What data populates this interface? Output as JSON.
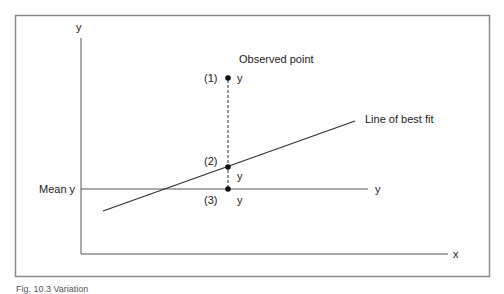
{
  "diagram": {
    "axes": {
      "y_label": "y",
      "x_label": "x"
    },
    "mean_line": {
      "left_label": "Mean y",
      "right_label": "y"
    },
    "best_fit": {
      "label": "Line of best fit"
    },
    "observed": {
      "label": "Observed point"
    },
    "points": [
      {
        "id": "(1)",
        "label": "(1)",
        "value_label": "y"
      },
      {
        "id": "(2)",
        "label": "(2)",
        "value_label": "y"
      },
      {
        "id": "(3)",
        "label": "(3)",
        "value_label": "y"
      }
    ],
    "caption": "Fig. 10.3  Variation"
  },
  "colors": {
    "frame": "#8a8a8a",
    "axis": "#555555",
    "line": "#333333",
    "point": "#111111"
  }
}
